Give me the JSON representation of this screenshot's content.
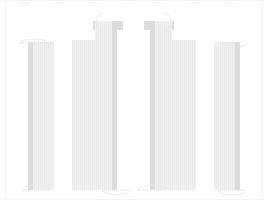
{
  "drawing": {
    "title": "Column Elevation Drawing",
    "background_color": "#ffffff",
    "frame_color": "#f4f4f4",
    "fill_light": "#f0f0f0",
    "fill_mid": "#e6e6e6",
    "fill_edge": "#dcdcdc",
    "hatch_color": "#eaeaea",
    "arc_color": "#e9e9e9",
    "leader_color": "#e3e3e3"
  },
  "top_dimensions": {
    "visible": true,
    "note": "faint dimension annotations along the top edge",
    "labels": [
      {
        "text": "2400",
        "x": 18,
        "y": 1
      },
      {
        "text": "1800",
        "x": 52,
        "y": 1
      },
      {
        "text": "900",
        "x": 88,
        "y": 1
      },
      {
        "text": "2",
        "x": 126,
        "y": 1
      },
      {
        "text": "900",
        "x": 152,
        "y": 1
      },
      {
        "text": "1800",
        "x": 188,
        "y": 1
      },
      {
        "text": "2400",
        "x": 224,
        "y": 1
      }
    ]
  },
  "columns": [
    {
      "id": "col-1",
      "name": "column-left-outer",
      "x": 28,
      "width": 26,
      "top": 42,
      "bottom": 190,
      "edge_width": 5,
      "edge_side": "left",
      "cap": null,
      "top_arc": {
        "cx": 34,
        "cy": 43,
        "rx": 14,
        "ry": 4,
        "side": "left"
      },
      "bottom_arc": {
        "cx": 36,
        "cy": 190,
        "rx": 14,
        "ry": 5,
        "side": "left"
      }
    },
    {
      "id": "col-2",
      "name": "column-left-inner-wide",
      "x": 72,
      "width": 28,
      "top": 40,
      "bottom": 190,
      "edge_width": 0,
      "edge_side": "none",
      "cap": null,
      "top_arc": null,
      "bottom_arc": null
    },
    {
      "id": "col-3",
      "name": "column-left-inner-tall",
      "x": 95,
      "width": 22,
      "top": 21,
      "bottom": 190,
      "edge_width": 5,
      "edge_side": "right",
      "cap": {
        "x": 93,
        "y": 21,
        "width": 30,
        "height": 9
      },
      "top_arc": {
        "cx": 96,
        "cy": 22,
        "rx": 7,
        "ry": 9,
        "side": "left"
      },
      "bottom_arc": {
        "cx": 116,
        "cy": 190,
        "rx": 14,
        "ry": 5,
        "side": "right"
      }
    },
    {
      "id": "col-4",
      "name": "column-right-inner-tall",
      "x": 150,
      "width": 22,
      "top": 21,
      "bottom": 190,
      "edge_width": 5,
      "edge_side": "left",
      "cap": {
        "x": 144,
        "y": 21,
        "width": 30,
        "height": 9
      },
      "top_arc": {
        "cx": 171,
        "cy": 22,
        "rx": 7,
        "ry": 9,
        "side": "right"
      },
      "bottom_arc": {
        "cx": 152,
        "cy": 190,
        "rx": 14,
        "ry": 5,
        "side": "left"
      }
    },
    {
      "id": "col-5",
      "name": "column-right-inner-wide",
      "x": 168,
      "width": 28,
      "top": 40,
      "bottom": 190,
      "edge_width": 0,
      "edge_side": "none",
      "cap": null,
      "top_arc": null,
      "bottom_arc": null
    },
    {
      "id": "col-6",
      "name": "column-right-outer",
      "x": 214,
      "width": 26,
      "top": 42,
      "bottom": 190,
      "edge_width": 5,
      "edge_side": "right",
      "cap": null,
      "top_arc": {
        "cx": 234,
        "cy": 43,
        "rx": 14,
        "ry": 4,
        "side": "right"
      },
      "bottom_arc": {
        "cx": 232,
        "cy": 190,
        "rx": 14,
        "ry": 5,
        "side": "right"
      }
    }
  ],
  "baseline": {
    "visible": true,
    "y": 199,
    "x1": 5,
    "x2": 262
  },
  "frame": {
    "visible": true,
    "x": 5,
    "y": 0,
    "width": 257,
    "height": 199
  }
}
